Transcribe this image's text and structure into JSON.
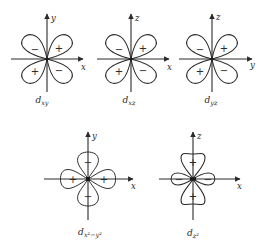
{
  "figure": {
    "orbitals": [
      {
        "id": "dxy",
        "label_main": "d",
        "label_sub": "xy",
        "horizontal_axis": "x",
        "vertical_axis": "y",
        "shape": "four-lobe-diagonal",
        "signs": {
          "upper_left": "−",
          "upper_right": "+",
          "lower_left": "+",
          "lower_right": "−"
        }
      },
      {
        "id": "dxz",
        "label_main": "d",
        "label_sub": "xz",
        "horizontal_axis": "x",
        "vertical_axis": "z",
        "shape": "four-lobe-diagonal",
        "signs": {
          "upper_left": "−",
          "upper_right": "+",
          "lower_left": "+",
          "lower_right": "−"
        }
      },
      {
        "id": "dyz",
        "label_main": "d",
        "label_sub": "yz",
        "horizontal_axis": "y",
        "vertical_axis": "z",
        "shape": "four-lobe-diagonal",
        "signs": {
          "upper_left": "−",
          "upper_right": "+",
          "lower_left": "+",
          "lower_right": "−"
        }
      },
      {
        "id": "dx2-y2",
        "label_main": "d",
        "label_sub": "x²−y²",
        "horizontal_axis": "x",
        "vertical_axis": "y",
        "shape": "four-lobe-on-axes",
        "signs": {
          "top": "−",
          "bottom": "−",
          "left": "+",
          "right": "+"
        }
      },
      {
        "id": "dz2",
        "label_main": "d",
        "label_sub": "z²",
        "horizontal_axis": "x",
        "vertical_axis": "z",
        "shape": "two-lobe-plus-torus",
        "signs": {
          "top": "+",
          "bottom": "+",
          "left": "−",
          "right": "−"
        }
      }
    ]
  }
}
